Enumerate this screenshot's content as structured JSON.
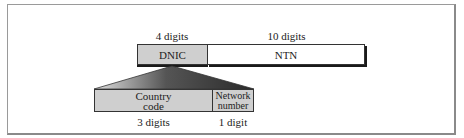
{
  "diagram": {
    "top_row": {
      "fields": [
        {
          "label": "DNIC",
          "digits_label": "4 digits",
          "fill": "#cfcfcf"
        },
        {
          "label": "NTN",
          "digits_label": "10 digits",
          "fill": "#ffffff"
        }
      ]
    },
    "bottom_row": {
      "expands": "DNIC",
      "fields": [
        {
          "label_line1": "Country",
          "label_line2": "code",
          "digits_label": "3 digits",
          "fill": "#cfcfcf"
        },
        {
          "label_line1": "Network",
          "label_line2": "number",
          "digits_label": "1 digit",
          "fill": "#cfcfcf"
        }
      ]
    },
    "colors": {
      "frame": "#9a9a9a",
      "box_border": "#333333",
      "gray_fill": "#cfcfcf",
      "wedge_dark": "#2e2e2e",
      "wedge_light": "#d8d8d8"
    }
  }
}
